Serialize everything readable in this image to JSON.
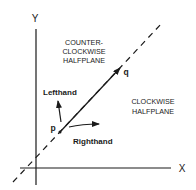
{
  "diagram": {
    "axes": {
      "x_label": "X",
      "y_label": "Y"
    },
    "points": {
      "p": "p",
      "q": "q"
    },
    "vectors": {
      "lefthand": "Lefthand",
      "righthand": "Righthand"
    },
    "regions": {
      "counter_clockwise": [
        "COUNTER-",
        "CLOCKWISE",
        "HALFPLANE"
      ],
      "clockwise": [
        "CLOCKWISE",
        "HALFPLANE"
      ]
    },
    "colors": {
      "ink": "#1a1a1a",
      "background": "#ffffff"
    }
  }
}
